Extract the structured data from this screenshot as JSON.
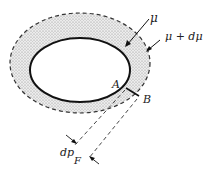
{
  "diagram": {
    "type": "flux-tube-cross-section",
    "labels": {
      "inner_surface": "μ",
      "outer_surface": "μ + dμ",
      "point_a": "A",
      "point_b": "B",
      "width_symbol": "dp",
      "width_subscript": "F"
    },
    "colors": {
      "line": "#111111",
      "stipple": "#8a8a8a",
      "ring_fill": "#e6e6e6",
      "background": "#ffffff"
    }
  }
}
